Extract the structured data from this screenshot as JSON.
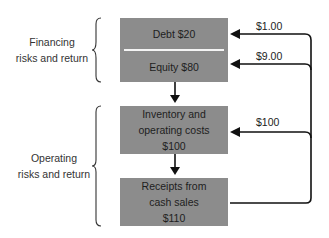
{
  "groups": {
    "financing": {
      "line1": "Financing",
      "line2": "risks and return"
    },
    "operating": {
      "line1": "Operating",
      "line2": "risks and return"
    }
  },
  "boxes": {
    "debt": "Debt $20",
    "equity": "Equity $80",
    "inventory": {
      "line1": "Inventory and",
      "line2": "operating costs",
      "line3": "$100"
    },
    "receipts": {
      "line1": "Receipts from",
      "line2": "cash sales",
      "line3": "$110"
    }
  },
  "flows": {
    "to_debt": "$1.00",
    "to_equity": "$9.00",
    "to_inventory": "$100"
  },
  "colors": {
    "box": "#8c8c8c",
    "line": "#111111",
    "divider": "#f4f4f4"
  }
}
